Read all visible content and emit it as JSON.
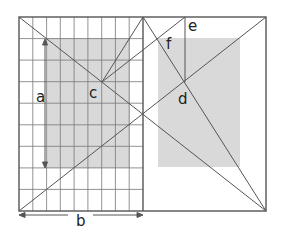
{
  "diagram": {
    "title": "",
    "labels": {
      "a": "a",
      "b": "b",
      "c": "c",
      "d": "d",
      "e": "e",
      "f": "f"
    },
    "colors": {
      "line": "#555555",
      "grid": "#777777",
      "shade": "#d9d9d9",
      "background": "#ffffff"
    },
    "frame": {
      "x1": 19,
      "y1": 17,
      "x2": 266,
      "y2": 211,
      "divider_x": 143
    },
    "grid": {
      "columns": 9,
      "rows": 9
    },
    "shaded_regions": [
      {
        "name": "left-shaded-rect",
        "x": 47,
        "y": 38,
        "w": 83,
        "h": 130
      },
      {
        "name": "right-shaded-rect",
        "x": 158,
        "y": 38,
        "w": 82,
        "h": 129
      }
    ],
    "points": {
      "c": {
        "x": 102,
        "y": 82
      },
      "d": {
        "x": 185,
        "y": 82
      }
    }
  }
}
